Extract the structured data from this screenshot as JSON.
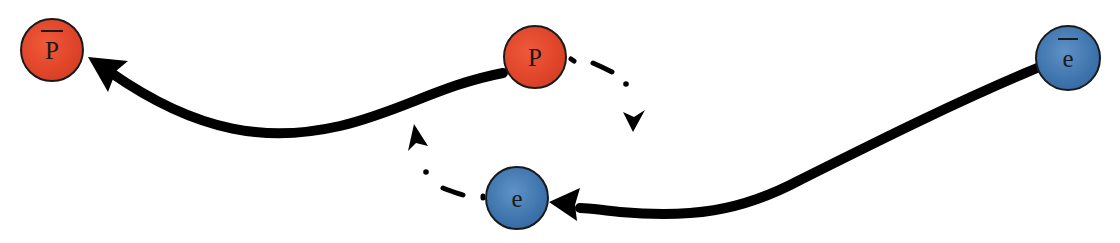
{
  "diagram": {
    "particles": [
      {
        "id": "antiproton",
        "label": "p",
        "overline": true,
        "color": "#e0452a",
        "cx": 52,
        "cy": 50,
        "r": 32
      },
      {
        "id": "proton",
        "label": "P",
        "overline": false,
        "color": "#e0452a",
        "cx": 535,
        "cy": 57,
        "r": 32
      },
      {
        "id": "positron",
        "label": "e",
        "overline": true,
        "color": "#3d73ac",
        "cx": 1068,
        "cy": 58,
        "r": 33
      },
      {
        "id": "electron",
        "label": "e",
        "overline": false,
        "color": "#3d73ac",
        "cx": 517,
        "cy": 198,
        "r": 32
      }
    ],
    "arrows": [
      {
        "from": "proton",
        "to": "antiproton",
        "style": "solid"
      },
      {
        "from": "positron",
        "to": "electron",
        "style": "solid"
      },
      {
        "from": "proton",
        "to": "down",
        "style": "dash-dot"
      },
      {
        "from": "electron",
        "to": "up",
        "style": "dash-dot"
      }
    ]
  },
  "labels": {
    "antiproton": "P",
    "proton": "P",
    "positron": "e",
    "electron": "e"
  }
}
